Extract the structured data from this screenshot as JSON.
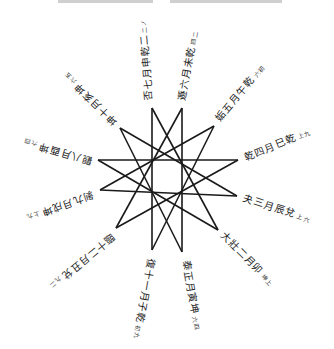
{
  "diagram": {
    "title": "",
    "type": "twelve-pointed star (12/5 polygram) with radial hexagram labels",
    "stroke_color": "#1a1a1a",
    "background": "#ffffff",
    "star_points": [
      [
        152,
        108
      ],
      [
        182,
        108
      ],
      [
        214,
        126
      ],
      [
        238,
        160
      ],
      [
        237,
        196
      ],
      [
        218,
        230
      ],
      [
        182,
        252
      ],
      [
        152,
        250
      ],
      [
        116,
        228
      ],
      [
        100,
        190
      ],
      [
        98,
        160
      ],
      [
        120,
        128
      ]
    ],
    "connection_step": 5
  },
  "labels": [
    {
      "id": "top-left",
      "text": "否七月申乾二",
      "note": "二ノ",
      "x": 150,
      "y": 100,
      "angle": -95
    },
    {
      "id": "top-right",
      "text": "遯六月未乾",
      "note": "四二",
      "x": 183,
      "y": 100,
      "angle": -80
    },
    {
      "id": "upper-right",
      "text": "姤五月午乾",
      "note": "六初",
      "x": 218,
      "y": 120,
      "angle": -50
    },
    {
      "id": "right-upper",
      "text": "乾四月巳乾",
      "note": "上九",
      "x": 245,
      "y": 158,
      "angle": -22
    },
    {
      "id": "right-lower",
      "text": "夬三月辰兌",
      "note": "上六",
      "x": 243,
      "y": 198,
      "angle": 18
    },
    {
      "id": "lower-right",
      "text": "大壯二月卯",
      "note": "坤上",
      "x": 222,
      "y": 234,
      "angle": 45
    },
    {
      "id": "bottom-right",
      "text": "泰正月寅坤",
      "note": "六四",
      "x": 185,
      "y": 260,
      "angle": 80
    },
    {
      "id": "bottom-left",
      "text": "復十一月子乾",
      "note": "初九",
      "x": 150,
      "y": 258,
      "angle": 100
    },
    {
      "id": "lower-left",
      "text": "臨十二月丑兌",
      "note": "九二",
      "x": 113,
      "y": 234,
      "angle": 140
    },
    {
      "id": "left-lower",
      "text": "剝九月戌坤",
      "note": "上九",
      "x": 93,
      "y": 193,
      "angle": 160
    },
    {
      "id": "left-upper",
      "text": "觀八月酉坤",
      "note": "六四",
      "x": 92,
      "y": 160,
      "angle": 196
    },
    {
      "id": "upper-left",
      "text": "坤十月亥坤",
      "note": "六五",
      "x": 116,
      "y": 122,
      "angle": 224
    }
  ]
}
